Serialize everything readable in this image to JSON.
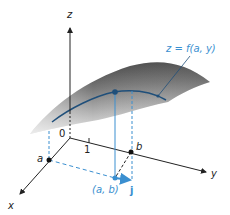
{
  "figure": {
    "axes": {
      "z_label": "z",
      "y_label": "y",
      "x_label": "x",
      "origin_label": "0",
      "tick_label": "1"
    },
    "points": {
      "a_label": "a",
      "b_label": "b",
      "ab_label": "(a, b)",
      "j_label": "j"
    },
    "curve_label": "z = f(a, y)",
    "colors": {
      "surface_dark": "#3a3a3a",
      "surface_light": "#c8c8c8",
      "curve": "#1f4f7a",
      "blue_accent": "#3a8fd0",
      "axis": "#222222"
    }
  }
}
